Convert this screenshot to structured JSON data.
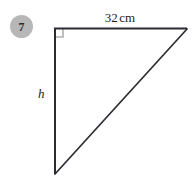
{
  "figure": {
    "question_number": "7",
    "shape": "right-triangle",
    "background_color": "#ffffff",
    "stroke_color": "#2b2b33",
    "badge_color": "#b7b7b7",
    "right_angle_marker_color": "#b0b0b4",
    "labels": {
      "top_side_value": "32",
      "top_side_unit": "cm",
      "left_side": "h"
    },
    "geometry": {
      "right_angle_vertex": [
        54,
        28
      ],
      "top_right_vertex": [
        187,
        29
      ],
      "bottom_vertex": [
        54,
        174
      ],
      "right_angle_marker_size": 9
    }
  }
}
